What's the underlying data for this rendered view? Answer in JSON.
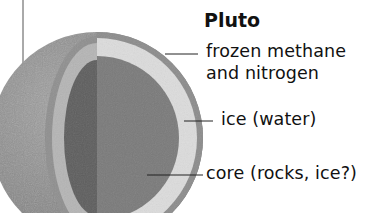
{
  "title": "Pluto",
  "labels": {
    "crust_line1": "frozen methane",
    "crust_line2": "and nitrogen",
    "mantle": "ice (water)",
    "core": "core (rocks, ice?)"
  },
  "colors": {
    "background": "#ffffff",
    "outer_surface": "#8a8a8a",
    "crust_ring": "#9a9a9a",
    "ice_layer_left": "#b9b9b9",
    "ice_layer_right": "#dadada",
    "core_left": "#5e5e5e",
    "core_right": "#7c7c7c",
    "leader_line": "#222222",
    "text": "#111111"
  }
}
